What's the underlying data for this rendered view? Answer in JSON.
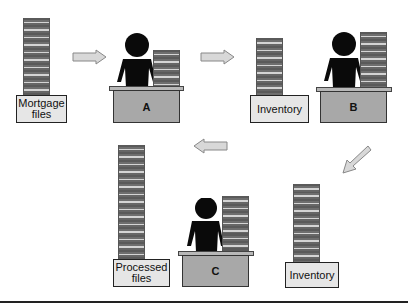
{
  "diagram": {
    "type": "process-flow",
    "nodes": [
      {
        "id": "mortgage_files",
        "label": "Mortgage files",
        "kind": "source-stack"
      },
      {
        "id": "worker_a",
        "label": "A",
        "kind": "worker-desk"
      },
      {
        "id": "inventory_1",
        "label": "Inventory",
        "kind": "buffer-stack"
      },
      {
        "id": "worker_b",
        "label": "B",
        "kind": "worker-desk"
      },
      {
        "id": "inventory_2",
        "label": "Inventory",
        "kind": "buffer-stack"
      },
      {
        "id": "worker_c",
        "label": "C",
        "kind": "worker-desk"
      },
      {
        "id": "processed_files",
        "label": "Processed files",
        "kind": "output-stack"
      }
    ],
    "edges": [
      {
        "from": "mortgage_files",
        "to": "worker_a",
        "direction": "right"
      },
      {
        "from": "worker_a",
        "to": "inventory_1",
        "direction": "right"
      },
      {
        "from": "worker_b",
        "to": "inventory_2",
        "direction": "down-left"
      },
      {
        "from": "worker_c",
        "to": "processed_files",
        "direction": "left"
      }
    ]
  },
  "labels": {
    "mortgage_line1": "Mortgage",
    "mortgage_line2": "files",
    "desk_a": "A",
    "inventory_top": "Inventory",
    "desk_b": "B",
    "inventory_bottom": "Inventory",
    "desk_c": "C",
    "processed_line1": "Processed",
    "processed_line2": "files"
  },
  "colors": {
    "arrow_fill": "#d8d8d8",
    "arrow_stroke": "#888888",
    "person": "#0a0a0a",
    "desk": "#a8a8a8",
    "label_box": "#e6e6e6"
  }
}
